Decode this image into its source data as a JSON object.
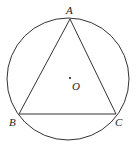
{
  "diagram": {
    "type": "geometry",
    "circle": {
      "center_label": "O",
      "cx": 68,
      "cy": 79,
      "r": 61
    },
    "points": {
      "A": {
        "label": "A",
        "x": 70,
        "y": 19
      },
      "B": {
        "label": "B",
        "x": 19,
        "y": 114
      },
      "C": {
        "label": "C",
        "x": 116,
        "y": 114
      },
      "O": {
        "label": "O",
        "x": 70,
        "y": 77
      }
    },
    "segments": [
      "AB",
      "BC",
      "CA"
    ],
    "colors": {
      "stroke": "#333333",
      "background": "#ffffff"
    }
  }
}
